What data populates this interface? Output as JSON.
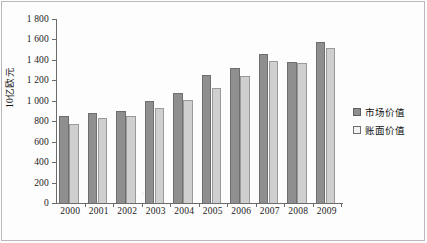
{
  "chart_data": {
    "type": "bar",
    "title": "",
    "xlabel": "",
    "ylabel": "10亿欧元",
    "ylim": [
      0,
      1800
    ],
    "yticks": [
      0,
      200,
      400,
      600,
      800,
      1000,
      1200,
      1400,
      1600,
      1800
    ],
    "ytick_labels": [
      "0",
      "200",
      "400",
      "600",
      "800",
      "1 000",
      "1 200",
      "1 400",
      "1 600",
      "1 800"
    ],
    "grid": false,
    "legend_position": "right",
    "categories": [
      "2000",
      "2001",
      "2002",
      "2003",
      "2004",
      "2005",
      "2006",
      "2007",
      "2008",
      "2009"
    ],
    "series": [
      {
        "name": "市场价值",
        "color": "#8f8f8f",
        "values": [
          855,
          880,
          900,
          995,
          1080,
          1250,
          1320,
          1460,
          1380,
          1580
        ]
      },
      {
        "name": "账面价值",
        "color": "#cfcfcf",
        "values": [
          775,
          830,
          850,
          930,
          1010,
          1130,
          1245,
          1390,
          1370,
          1520
        ]
      }
    ]
  },
  "legend": {
    "items": [
      {
        "label": "市场价值",
        "swatch": "market"
      },
      {
        "label": "账面价值",
        "swatch": "book"
      }
    ]
  },
  "axes": {
    "y_title": "10亿欧元"
  }
}
